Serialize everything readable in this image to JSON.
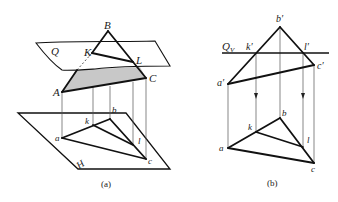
{
  "figure_a": {
    "caption": "(a)",
    "labels": {
      "B": "B",
      "K": "K",
      "L": "L",
      "A": "A",
      "C": "C",
      "Q": "Q",
      "H": "H",
      "a": "a",
      "b": "b",
      "c": "c",
      "k": "k",
      "l": "l"
    },
    "shaded_fill": "#c8c8c8"
  },
  "figure_b": {
    "caption": "(b)",
    "labels": {
      "b_prime": "b′",
      "k_prime": "k′",
      "l_prime": "l′",
      "c_prime": "c′",
      "a_prime": "a′",
      "Qv_main": "Q",
      "Qv_sub": "V",
      "a": "a",
      "b": "b",
      "c": "c",
      "k": "k",
      "l": "l"
    }
  }
}
